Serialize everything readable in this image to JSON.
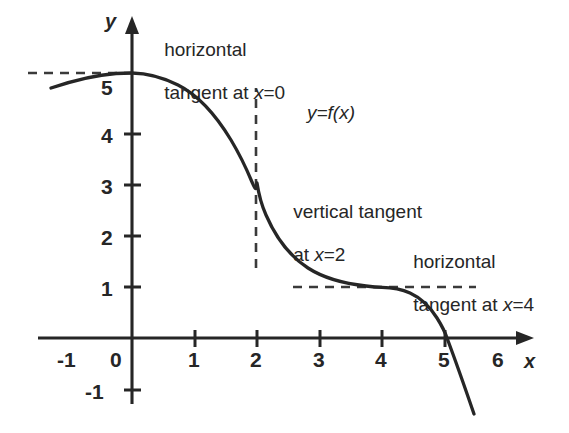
{
  "figure": {
    "background_color": "#ffffff",
    "ink_color": "#262626",
    "axis_labels": {
      "x": "x",
      "y": "y"
    },
    "function_label": "y=f(x)",
    "annotations": [
      {
        "id": "horizontal-tangent-x0",
        "line1": "horizontal",
        "line2": "tangent at x=0"
      },
      {
        "id": "vertical-tangent-x2",
        "line1": "vertical tangent",
        "line2": "at x=2"
      },
      {
        "id": "horizontal-tangent-x4",
        "line1": "horizontal",
        "line2": "tangent at x=4"
      }
    ],
    "x_ticks": [
      "-1",
      "0",
      "1",
      "2",
      "3",
      "4",
      "5",
      "6"
    ],
    "y_ticks": [
      "-1",
      "1",
      "2",
      "3",
      "4",
      "5"
    ]
  },
  "chart_data": {
    "type": "line",
    "title": "",
    "xlabel": "x",
    "ylabel": "y",
    "xlim": [
      -1.6,
      6.5
    ],
    "ylim": [
      -1.8,
      6.2
    ],
    "grid": false,
    "legend": "none",
    "series": [
      {
        "name": "y=f(x)",
        "x": [
          -1.3,
          -1.1,
          -0.9,
          -0.7,
          -0.5,
          -0.3,
          -0.15,
          0.0,
          0.2,
          0.4,
          0.6,
          0.8,
          1.0,
          1.2,
          1.4,
          1.6,
          1.8,
          1.9,
          2.0,
          2.1,
          2.2,
          2.4,
          2.6,
          2.8,
          3.0,
          3.2,
          3.4,
          3.6,
          3.8,
          4.0,
          4.2,
          4.4,
          4.6,
          4.8,
          5.0,
          5.15,
          5.3,
          5.45
        ],
        "y": [
          4.9,
          5.0,
          5.08,
          5.14,
          5.18,
          5.2,
          5.21,
          5.21,
          5.2,
          5.16,
          5.1,
          5.0,
          4.86,
          4.66,
          4.38,
          4.02,
          3.62,
          3.36,
          3.05,
          2.72,
          2.46,
          2.06,
          1.76,
          1.54,
          1.38,
          1.26,
          1.17,
          1.1,
          1.05,
          1.0,
          0.94,
          0.84,
          0.66,
          0.38,
          0.0,
          -0.36,
          -0.85,
          -1.5
        ]
      }
    ],
    "annotated_points": [
      {
        "x": 0,
        "y": 5.21,
        "feature": "horizontal tangent"
      },
      {
        "x": 2,
        "y": 3.05,
        "feature": "vertical tangent"
      },
      {
        "x": 4,
        "y": 1.0,
        "feature": "horizontal tangent"
      },
      {
        "x": 5,
        "y": 0.0,
        "feature": "x-intercept"
      }
    ],
    "guide_lines": [
      {
        "id": "dashed-y-5.2",
        "orientation": "horizontal",
        "value": 5.21,
        "from": -1.65,
        "to": 0.05,
        "style": "dashed"
      },
      {
        "id": "dashed-x-2",
        "orientation": "vertical",
        "value": 2.0,
        "from": 1.37,
        "to": 4.9,
        "style": "dashed"
      },
      {
        "id": "dashed-y-1",
        "orientation": "horizontal",
        "value": 1.0,
        "from": 2.58,
        "to": 5.5,
        "style": "dashed"
      }
    ]
  }
}
